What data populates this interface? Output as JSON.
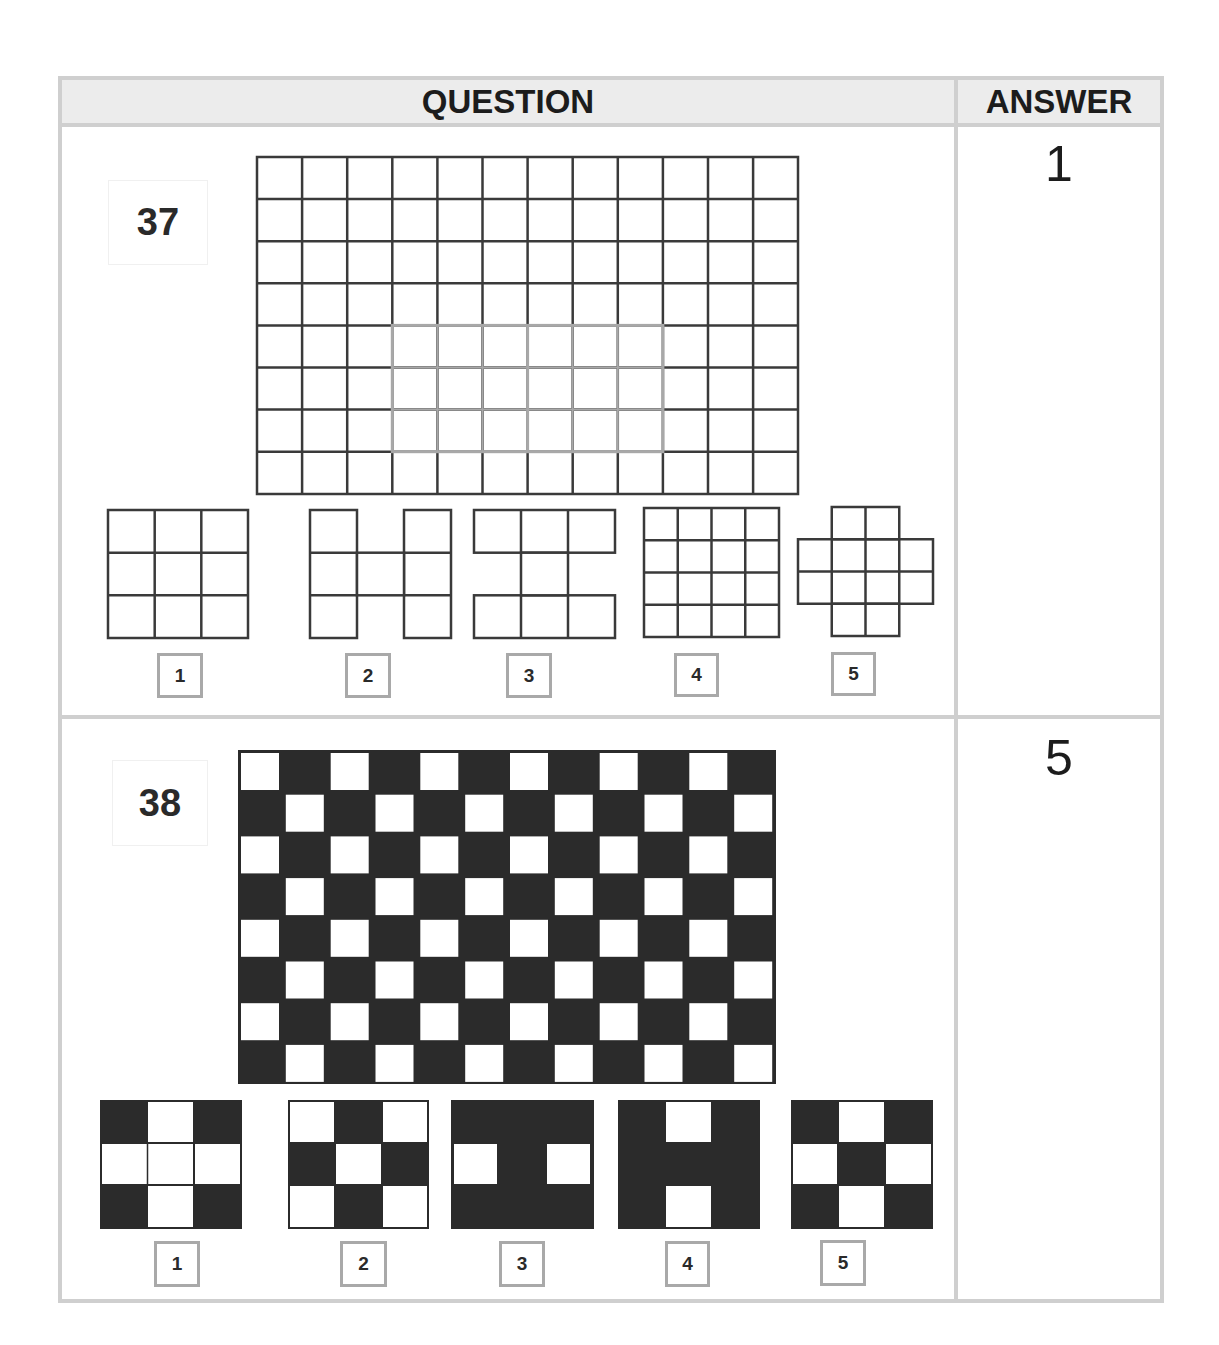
{
  "header": {
    "question_label": "QUESTION",
    "answer_label": "ANSWER"
  },
  "colors": {
    "border": "#cfcfcf",
    "header_bg": "#ececec",
    "grid_line": "#3a3a3a",
    "highlight_line": "#a8a8a8",
    "fill_dark": "#2b2b2b",
    "label_border": "#a9a9a9"
  },
  "questions": [
    {
      "number": "37",
      "answer": "1",
      "figure": {
        "type": "line-grid",
        "cols": 12,
        "rows": 8,
        "highlight": {
          "col_start": 3,
          "col_end": 9,
          "row_start": 4,
          "row_end": 7,
          "split_col": 6
        }
      },
      "options": [
        {
          "label": "1",
          "shape": "3x3 full grid"
        },
        {
          "label": "2",
          "shape": "H-shape (3x3 without top-middle and bottom-middle)"
        },
        {
          "label": "3",
          "shape": "I-shape (3x3 without middle-left and middle-right)"
        },
        {
          "label": "4",
          "shape": "4x4 full grid"
        },
        {
          "label": "5",
          "shape": "4x4 plus-shape without corners"
        }
      ]
    },
    {
      "number": "38",
      "answer": "5",
      "figure": {
        "type": "checkerboard",
        "cols": 12,
        "rows": 8,
        "top_left": "white"
      },
      "options": [
        {
          "label": "1",
          "pattern": [
            "BWB",
            "WWW",
            "BWB"
          ]
        },
        {
          "label": "2",
          "pattern": [
            "WBW",
            "BWB",
            "WBW"
          ]
        },
        {
          "label": "3",
          "pattern": [
            "BBB",
            "WBW",
            "BBB"
          ]
        },
        {
          "label": "4",
          "pattern": [
            "BWB",
            "BBB",
            "BWB"
          ]
        },
        {
          "label": "5",
          "pattern": [
            "BWB",
            "WBW",
            "BWB"
          ]
        }
      ]
    }
  ]
}
